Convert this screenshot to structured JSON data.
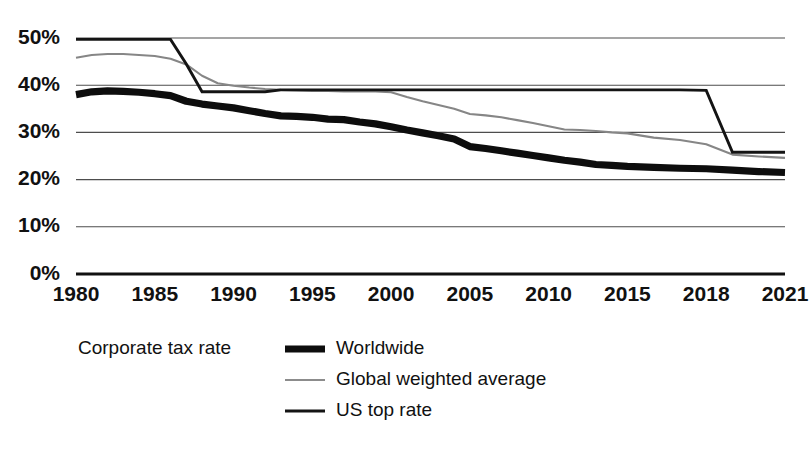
{
  "chart_data": {
    "type": "line",
    "title": "",
    "subtitle": "",
    "xlabel": "",
    "ylabel": "",
    "legend_title": "Corporate tax rate",
    "legend_position": "bottom-left",
    "grid": true,
    "ylim": [
      0,
      50
    ],
    "yticks": [
      0,
      10,
      20,
      30,
      40,
      50
    ],
    "ytick_labels": [
      "0%",
      "10%",
      "20%",
      "30%",
      "40%",
      "50%"
    ],
    "xlim": [
      1980,
      2021
    ],
    "xticks": [
      1980,
      1985,
      1990,
      1995,
      2000,
      2005,
      2010,
      2015,
      2018,
      2021
    ],
    "xtick_labels": [
      "1980",
      "1985",
      "1990",
      "1995",
      "2000",
      "2005",
      "2010",
      "2015",
      "2018",
      "2021"
    ],
    "x": [
      1980,
      1981,
      1982,
      1983,
      1984,
      1985,
      1986,
      1987,
      1988,
      1989,
      1990,
      1991,
      1992,
      1993,
      1994,
      1995,
      1996,
      1997,
      1998,
      1999,
      2000,
      2001,
      2002,
      2003,
      2004,
      2005,
      2006,
      2007,
      2008,
      2009,
      2010,
      2011,
      2012,
      2013,
      2014,
      2015,
      2016,
      2017,
      2018,
      2019,
      2020,
      2021
    ],
    "series": [
      {
        "name": "Worldwide",
        "color": "#0d0d0d",
        "style": "thick-solid",
        "values": [
          38.0,
          38.6,
          38.8,
          38.7,
          38.5,
          38.2,
          37.8,
          36.6,
          36.0,
          35.6,
          35.2,
          34.6,
          34.0,
          33.5,
          33.4,
          33.2,
          32.8,
          32.7,
          32.2,
          31.8,
          31.2,
          30.5,
          29.9,
          29.3,
          28.6,
          27.0,
          26.6,
          26.1,
          25.6,
          25.1,
          24.6,
          24.1,
          23.7,
          23.2,
          23.0,
          22.8,
          22.6,
          22.4,
          22.3,
          22.0,
          21.7,
          21.5
        ]
      },
      {
        "name": "Global weighted average",
        "color": "#868686",
        "style": "thin-solid",
        "values": [
          45.8,
          46.4,
          46.6,
          46.6,
          46.4,
          46.2,
          45.6,
          44.4,
          42.0,
          40.4,
          39.9,
          39.5,
          39.2,
          39.0,
          38.9,
          38.8,
          38.8,
          38.7,
          38.7,
          38.7,
          38.5,
          37.5,
          36.6,
          35.8,
          35.0,
          33.9,
          33.6,
          33.2,
          32.6,
          32.0,
          31.3,
          30.6,
          30.5,
          30.3,
          30.0,
          29.8,
          28.9,
          28.4,
          27.5,
          25.3,
          24.9,
          24.6
        ]
      },
      {
        "name": "US top rate",
        "color": "#141414",
        "style": "medium-solid",
        "values": [
          49.7,
          49.7,
          49.7,
          49.7,
          49.7,
          49.7,
          49.7,
          44.5,
          38.6,
          38.6,
          38.6,
          38.6,
          38.6,
          39.0,
          39.0,
          39.0,
          39.0,
          39.0,
          39.0,
          39.0,
          39.0,
          39.0,
          39.0,
          39.0,
          39.0,
          39.0,
          39.0,
          39.0,
          39.0,
          39.0,
          39.0,
          39.0,
          39.0,
          39.0,
          39.0,
          39.0,
          39.0,
          39.0,
          38.9,
          25.8,
          25.8,
          25.8
        ]
      }
    ]
  },
  "legend": {
    "title": "Corporate tax rate",
    "items": [
      {
        "label": "Worldwide",
        "swatch": "thick-black-line"
      },
      {
        "label": "Global weighted average",
        "swatch": "thin-gray-line"
      },
      {
        "label": "US top rate",
        "swatch": "medium-black-line"
      }
    ]
  },
  "colors": {
    "worldwide": "#0d0d0d",
    "global_weighted": "#868686",
    "us_top_rate": "#141414",
    "grid": "#4d4d4d",
    "axis": "#111111",
    "background": "#ffffff"
  }
}
